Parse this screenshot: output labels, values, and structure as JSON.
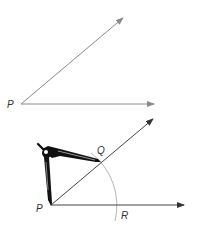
{
  "figure_top": {
    "title": "Angle at P",
    "vertex_label": "P",
    "vertex": [
      21,
      104
    ],
    "ray_upper_tip": [
      123,
      18
    ],
    "ray_lower_tip": [
      154,
      104
    ],
    "line_color": "#8a8a8a"
  },
  "figure_bottom": {
    "title": "Compass marking arc from P",
    "vertex_label": "P",
    "point_q_label": "Q",
    "point_r_label": "R",
    "vertex": [
      51,
      205
    ],
    "ray_upper_tip": [
      153,
      119
    ],
    "ray_lower_tip": [
      184,
      205
    ],
    "arc_radius": 66,
    "line_color": "#555555",
    "arc_color": "#b0b0b0",
    "compass_color": "#111111"
  }
}
